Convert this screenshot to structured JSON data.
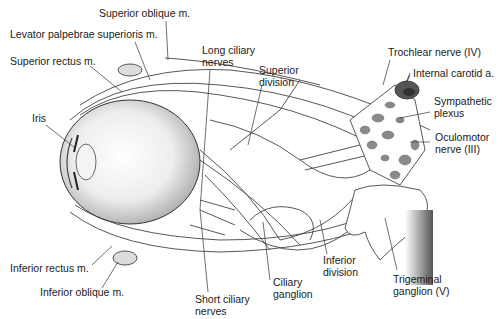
{
  "diagram": {
    "type": "anatomical-illustration",
    "labels": {
      "superior_oblique": "Superior oblique m.",
      "levator": "Levator palpebrae superioris m.",
      "superior_rectus": "Superior rectus m.",
      "iris": "Iris",
      "long_ciliary_1": "Long ciliary",
      "long_ciliary_2": "nerves",
      "superior_division_1": "Superior",
      "superior_division_2": "division",
      "trochlear": "Trochlear nerve (IV)",
      "internal_carotid": "Internal carotid a.",
      "sympathetic_1": "Sympathetic",
      "sympathetic_2": "plexus",
      "oculomotor_1": "Oculomotor",
      "oculomotor_2": "nerve (III)",
      "inferior_rectus": "Inferior rectus m.",
      "inferior_oblique": "Inferior oblique m.",
      "short_ciliary_1": "Short ciliary",
      "short_ciliary_2": "nerves",
      "ciliary_ganglion_1": "Ciliary",
      "ciliary_ganglion_2": "ganglion",
      "inferior_division_1": "Inferior",
      "inferior_division_2": "division",
      "trigeminal_1": "Trigeminal",
      "trigeminal_2": "ganglion (V)"
    },
    "colors": {
      "line": "#333333",
      "muscle_fill": "#dcdcdc",
      "plexus_fill": "#8a8a8a",
      "background": "#ffffff"
    }
  }
}
